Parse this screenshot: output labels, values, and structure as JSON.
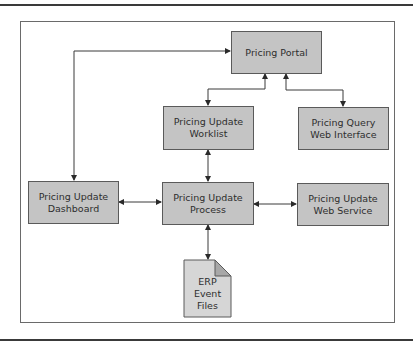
{
  "diagram": {
    "nodes": {
      "portal": {
        "label": "Pricing Portal"
      },
      "worklist": {
        "label": "Pricing Update\nWorklist"
      },
      "query": {
        "label": "Pricing Query\nWeb Interface"
      },
      "dashboard": {
        "label": "Pricing Update\nDashboard"
      },
      "process": {
        "label": "Pricing Update\nProcess"
      },
      "webservice": {
        "label": "Pricing Update\nWeb Service"
      },
      "erp": {
        "label": "ERP\nEvent\nFiles",
        "shape": "document-icon"
      }
    },
    "edges": [
      {
        "from": "dashboard",
        "to": "portal",
        "direction": "bidirectional"
      },
      {
        "from": "portal",
        "to": "worklist",
        "direction": "bidirectional"
      },
      {
        "from": "portal",
        "to": "query",
        "direction": "bidirectional"
      },
      {
        "from": "worklist",
        "to": "process",
        "direction": "bidirectional"
      },
      {
        "from": "dashboard",
        "to": "process",
        "direction": "bidirectional"
      },
      {
        "from": "process",
        "to": "webservice",
        "direction": "bidirectional"
      },
      {
        "from": "process",
        "to": "erp",
        "direction": "bidirectional"
      }
    ],
    "colors": {
      "box_fill": "#c4c4c4",
      "file_fill": "#d6d6d6",
      "line": "#3a3a3a"
    }
  }
}
